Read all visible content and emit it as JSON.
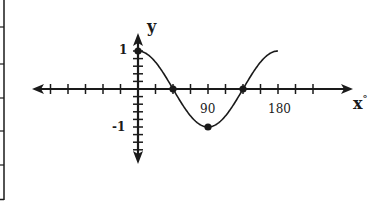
{
  "chart_data": {
    "type": "line",
    "title": "",
    "function": "y = cos(2x)",
    "xlabel": "x°",
    "ylabel": "y",
    "x_tick_labels": [
      "90",
      "180"
    ],
    "y_tick_labels": [
      "1",
      "-1"
    ],
    "x_tick_step_degrees": 22.5,
    "xlim": [
      -135,
      270
    ],
    "ylim": [
      -1.9,
      1.4
    ],
    "curve_domain": [
      0,
      180
    ],
    "marked_points": [
      {
        "x": 0,
        "y": 1
      },
      {
        "x": 45,
        "y": 0
      },
      {
        "x": 90,
        "y": -1
      },
      {
        "x": 135,
        "y": 0
      }
    ],
    "grid": false,
    "legend": null
  },
  "labels": {
    "y_axis": "y",
    "x_axis": "x",
    "x_axis_degree": "°",
    "y_one": "1",
    "y_neg_one": "-1",
    "x_ninety": "90",
    "x_one_eighty": "180"
  },
  "colors": {
    "ink": "#1a1a1a",
    "background": "#ffffff"
  }
}
